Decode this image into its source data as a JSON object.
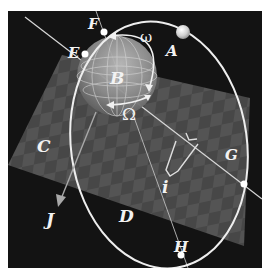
{
  "diagram": {
    "type": "orbital-elements",
    "background_color": "#121212",
    "plane_color": "#555555",
    "orbit_color": "#eeeeee",
    "labels": {
      "A": "A",
      "B": "B",
      "C": "C",
      "D": "D",
      "E": "E",
      "F": "F",
      "G": "G",
      "H": "H",
      "J": "J",
      "omega": "ω",
      "Omega": "Ω",
      "inclination": "i"
    }
  }
}
